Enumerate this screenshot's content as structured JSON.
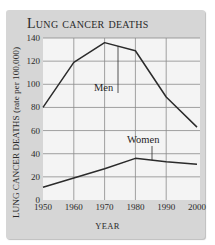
{
  "chart_data": {
    "type": "line",
    "title": "Lung cancer deaths",
    "xlabel": "YEAR",
    "ylabel": "LUNG CANCER DEATHS (rate per 100,000)",
    "x": [
      1950,
      1960,
      1970,
      1980,
      1990,
      2000
    ],
    "x_ticks": [
      "1950",
      "1960",
      "1970",
      "1980",
      "1990",
      "2000"
    ],
    "y_ticks": [
      "0",
      "20",
      "40",
      "60",
      "80",
      "100",
      "120",
      "140"
    ],
    "ylim": [
      0,
      140
    ],
    "xlim": [
      1950,
      2000
    ],
    "grid": true,
    "legend": "inline labels",
    "series": [
      {
        "name": "Men",
        "values": [
          80,
          119,
          136,
          129,
          89,
          63
        ]
      },
      {
        "name": "Women",
        "values": [
          11,
          19,
          27,
          36,
          33,
          31
        ]
      }
    ]
  },
  "colors": {
    "panel_bg": "#d6d6d6",
    "plot_bg": "#f4f4f4",
    "grid": "#8a8a8a",
    "line": "#2b2b2b"
  }
}
